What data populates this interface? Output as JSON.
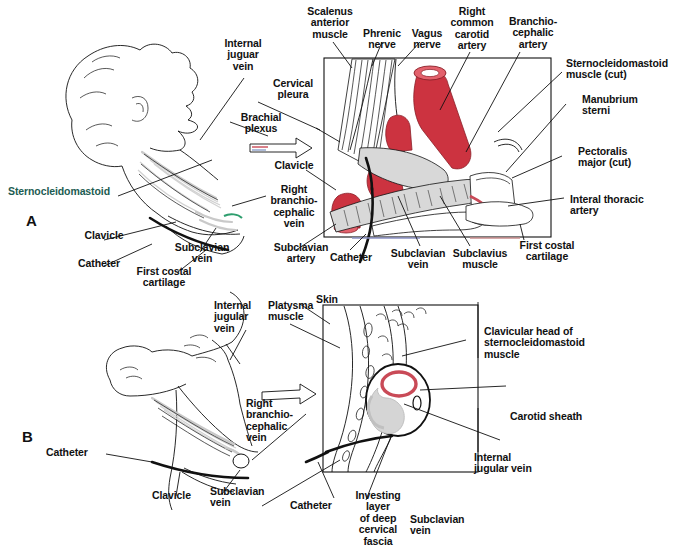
{
  "figure": {
    "panels": [
      {
        "id": "A",
        "letter": "A"
      },
      {
        "id": "B",
        "letter": "B"
      }
    ],
    "colors": {
      "artery_red": "#cc3340",
      "carotid_ring_red": "#c94a57",
      "outline_black": "#111111",
      "muscle_gray": "#c9c9c9",
      "sternocleidomastoid_label": "#1d5c52",
      "paper_white": "#ffffff"
    }
  },
  "panel_a": {
    "letter": "A",
    "labels": {
      "sternocleidomastoid": "Sternocleidomastoid",
      "internal_jugular_vein": "Internal\njuguar\nvein",
      "cervical_pleura": "Cervical\npleura",
      "brachial_plexus": "Brachial\nplexus",
      "clavicle_mid": "Clavicle",
      "right_brachiocephalic_vein": "Right\nbranchio-\ncephalic\nvein",
      "clavicle_left": "Clavicle",
      "catheter_left": "Catheter",
      "subclavian_vein_left": "Subclavian\nvein",
      "first_costal_cartilage_left": "First costal\ncartilage",
      "subclavian_artery": "Subclavian\nartery",
      "scalenus_anterior_muscle": "Scalenus\nanterior\nmuscle",
      "phrenic_nerve": "Phrenic\nnerve",
      "vagus_nerve": "Vagus\nnerve",
      "right_common_carotid_artery": "Right\ncommon\ncarotid\nartery",
      "brachiocephalic_artery": "Branchio-\ncephalic\nartery",
      "sternocleidomastoid_muscle_cut": "Sternocleidomastoid\nmuscle (cut)",
      "manubrium_sterni": "Manubrium\nsterni",
      "pectoralis_major_cut": "Pectoralis\nmajor (cut)",
      "internal_thoracic_artery": "Interal thoracic\nartery",
      "catheter_box": "Catheter",
      "subclavian_vein_box": "Subclavian\nvein",
      "subclavius_muscle": "Subclavius\nmuscle",
      "first_costal_cartilage_right": "First costal\ncartilage"
    }
  },
  "panel_b": {
    "letter": "B",
    "labels": {
      "internal_jugular_vein": "Internal\njugular\nvein",
      "platysma_muscle": "Platysma\nmuscle",
      "skin": "Skin",
      "right_brachiocephalic_vein": "Right\nbranchio-\ncephalic\nvein",
      "catheter_left": "Catheter",
      "clavicle": "Clavicle",
      "subclavian_vein_left": "Subclavian\nvein",
      "catheter_box": "Catheter",
      "clavicular_head_scm": "Clavicular head of\nsternocleidomastoid\nmuscle",
      "carotid_sheath": "Carotid sheath",
      "internal_jugular_vein_right": "Internal\njugular vein",
      "investing_layer": "Investing\nlayer\nof deep\ncervical\nfascia",
      "subclavian_vein_box": "Subclavian\nvein"
    }
  }
}
